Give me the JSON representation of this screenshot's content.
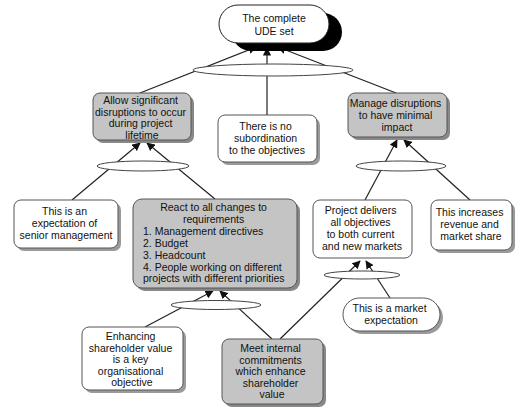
{
  "diagram": {
    "type": "current-reality-tree",
    "colors": {
      "gray_fill": "#c4c4c4",
      "white_fill": "#ffffff",
      "stroke": "#333333",
      "shadow": "#8a8a8a",
      "root_shadow": "#000000"
    },
    "nodes": {
      "root": {
        "lines": [
          "The complete",
          "UDE set"
        ],
        "style": "pill-white-black-shadow"
      },
      "allow": {
        "lines": [
          "Allow significant",
          "disruptions to occur",
          "during project",
          "lifetime"
        ],
        "style": "gray"
      },
      "no_subordination": {
        "lines": [
          "There is no",
          "subordination",
          "to the objectives"
        ],
        "style": "white"
      },
      "manage": {
        "lines": [
          "Manage disruptions",
          "to have minimal",
          "impact"
        ],
        "style": "gray"
      },
      "senior_mgmt": {
        "lines": [
          "This is an",
          "expectation of",
          "senior management"
        ],
        "style": "white"
      },
      "react": {
        "lines": [
          "React to all changes to",
          "requirements"
        ],
        "list": [
          "1.  Management directives",
          "2.  Budget",
          "3.  Headcount",
          "4.  People working on different",
          "projects with different priorities"
        ],
        "style": "gray"
      },
      "project_delivers": {
        "lines": [
          "Project delivers",
          "all objectives",
          "to both current",
          "and new markets"
        ],
        "style": "white"
      },
      "revenue": {
        "lines": [
          "This increases",
          "revenue and",
          "market share"
        ],
        "style": "white"
      },
      "market_expectation": {
        "lines": [
          "This is a market",
          "expectation"
        ],
        "style": "pill-white"
      },
      "shareholder_value": {
        "lines": [
          "Enhancing",
          "shareholder value",
          "is a key",
          "organisational",
          "objective"
        ],
        "style": "white"
      },
      "meet_commitments": {
        "lines": [
          "Meet internal",
          "commitments",
          "which enhance",
          "shareholder",
          "value"
        ],
        "style": "gray"
      }
    },
    "edges": [
      {
        "from": "allow",
        "to": "root",
        "via": "top-ellipse"
      },
      {
        "from": "no_subordination",
        "to": "root",
        "via": "top-ellipse"
      },
      {
        "from": "manage",
        "to": "root",
        "via": "top-ellipse"
      },
      {
        "from": "senior_mgmt",
        "to": "allow",
        "via": "allow-ellipse"
      },
      {
        "from": "react",
        "to": "allow",
        "via": "allow-ellipse"
      },
      {
        "from": "project_delivers",
        "to": "manage",
        "via": "manage-ellipse"
      },
      {
        "from": "revenue",
        "to": "manage",
        "via": "manage-ellipse"
      },
      {
        "from": "meet_commitments",
        "to": "project_delivers",
        "via": "project-ellipse"
      },
      {
        "from": "market_expectation",
        "to": "project_delivers",
        "via": "project-ellipse"
      },
      {
        "from": "shareholder_value",
        "to": "react",
        "via": "react-ellipse"
      },
      {
        "from": "meet_commitments",
        "to": "react",
        "via": "react-ellipse"
      }
    ]
  }
}
